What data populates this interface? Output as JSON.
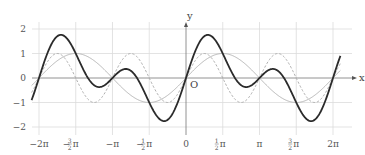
{
  "chart_data": {
    "type": "line",
    "title": "",
    "xlabel": "x",
    "ylabel": "y",
    "origin_label": "O",
    "xlim": [
      -6.65,
      6.65
    ],
    "ylim": [
      -2.1,
      2.1
    ],
    "grid": true,
    "legend": "none",
    "x_ticks": [
      {
        "value": -6.2832,
        "label": "−2π",
        "minus": "",
        "frac": "",
        "sym": "−2π"
      },
      {
        "value": -4.7124,
        "label": "−3/2 π",
        "minus": "−",
        "frac": "3/2",
        "sym": "π"
      },
      {
        "value": -3.1416,
        "label": "−π",
        "minus": "",
        "frac": "",
        "sym": "−π"
      },
      {
        "value": -1.5708,
        "label": "−1/2 π",
        "minus": "−",
        "frac": "1/2",
        "sym": "π"
      },
      {
        "value": 0,
        "label": "0",
        "minus": "",
        "frac": "",
        "sym": "0"
      },
      {
        "value": 1.5708,
        "label": "1/2 π",
        "minus": "",
        "frac": "1/2",
        "sym": "π"
      },
      {
        "value": 3.1416,
        "label": "π",
        "minus": "",
        "frac": "",
        "sym": "π"
      },
      {
        "value": 4.7124,
        "label": "3/2 π",
        "minus": "",
        "frac": "3/2",
        "sym": "π"
      },
      {
        "value": 6.2832,
        "label": "2π",
        "minus": "",
        "frac": "",
        "sym": "2π"
      }
    ],
    "y_ticks": [
      {
        "value": 2,
        "label": "2"
      },
      {
        "value": 1,
        "label": "1"
      },
      {
        "value": 0,
        "label": "0"
      },
      {
        "value": -1,
        "label": "−1"
      },
      {
        "value": -2,
        "label": "−2"
      }
    ],
    "series": [
      {
        "name": "y = sin x",
        "expr": "sin(x)",
        "style": "solid-light",
        "color": "#b8b8b8",
        "domain": [
          -6.6,
          6.6
        ]
      },
      {
        "name": "y = sin 2x",
        "expr": "sin(2x)",
        "style": "dashed",
        "color": "#b0b0b0",
        "domain": [
          -6.6,
          6.6
        ]
      },
      {
        "name": "y = sin x + sin 2x",
        "expr": "sin(x)+sin(2x)",
        "style": "solid-bold",
        "color": "#2b2b2b",
        "domain": [
          -6.6,
          6.6
        ]
      }
    ]
  }
}
